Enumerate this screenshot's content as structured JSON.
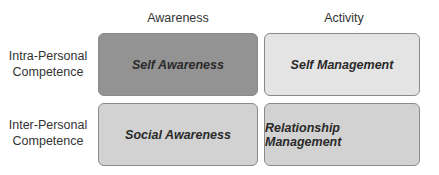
{
  "columns": [
    {
      "label": "Awareness"
    },
    {
      "label": "Activity"
    }
  ],
  "rows": [
    {
      "label_line1": "Intra-Personal",
      "label_line2": "Competence"
    },
    {
      "label_line1": "Inter-Personal",
      "label_line2": "Competence"
    }
  ],
  "cells": [
    {
      "label": "Self Awareness",
      "color": "#939393"
    },
    {
      "label": "Self Management",
      "color": "#e4e4e4"
    },
    {
      "label": "Social Awareness",
      "color": "#d2d2d2"
    },
    {
      "label": "Relationship Management",
      "color": "#d2d2d2"
    }
  ]
}
